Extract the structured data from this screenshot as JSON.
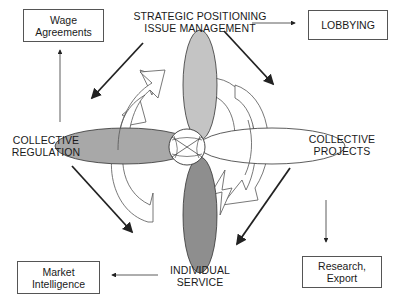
{
  "center": {
    "top_label_line1": "STRATEGIC POSITIONING",
    "top_label_line2": "ISSUE MANAGEMENT",
    "left_label_line1": "COLLECTIVE",
    "left_label_line2": "REGULATION",
    "right_label_line1": "COLLECTIVE",
    "right_label_line2": "PROJECTS",
    "bottom_label_line1": "INDIVIDUAL",
    "bottom_label_line2": "SERVICE"
  },
  "boxes": {
    "wage_line1": "Wage",
    "wage_line2": "Agreements",
    "lobbying": "LOBBYING",
    "market_line1": "Market",
    "market_line2": "Intelligence",
    "research_line1": "Research,",
    "research_line2": "Export"
  },
  "colors": {
    "petal_top": "#c4c4c4",
    "petal_left": "#a8a8a8",
    "petal_bottom": "#8e8e8e",
    "petal_right": "#ffffff",
    "stroke": "#333333"
  }
}
